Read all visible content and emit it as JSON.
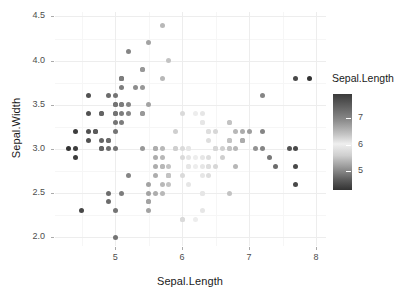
{
  "chart_data": {
    "type": "scatter",
    "title": "",
    "xlabel": "Sepal.Length",
    "ylabel": "Sepal.Width",
    "xlim": [
      4.1,
      8.15
    ],
    "ylim": [
      1.9,
      4.55
    ],
    "xticks": [
      5,
      6,
      7,
      8
    ],
    "xticklabels": [
      "5",
      "6",
      "7",
      "8"
    ],
    "yticks": [
      2.0,
      2.5,
      3.0,
      3.5,
      4.0,
      4.5
    ],
    "yticklabels": [
      "2.0",
      "2.5",
      "3.0",
      "3.5",
      "4.0",
      "4.5"
    ],
    "grid": true,
    "grid_color": "#ededed",
    "panel_background": "#ffffff",
    "point_size": 5,
    "color_by": "Sepal.Length",
    "colorscale": {
      "type": "continuous-gradient",
      "stops": [
        "#333333",
        "#6e6e6e",
        "#efefef",
        "#9a9a9a",
        "#333333"
      ],
      "note": "grayscale: dark at low values, lightest near 6, dark again at high values"
    },
    "legend": {
      "title": "Sepal.Length",
      "position": "right",
      "orientation": "vertical",
      "ticks": [
        7,
        6,
        5
      ],
      "ticklabels": [
        "7",
        "6",
        "5"
      ]
    },
    "x": [
      5.1,
      4.9,
      4.7,
      4.6,
      5.0,
      5.4,
      4.6,
      5.0,
      4.4,
      4.9,
      5.4,
      4.8,
      4.8,
      4.3,
      5.8,
      5.7,
      5.4,
      5.1,
      5.7,
      5.1,
      5.4,
      5.1,
      4.6,
      5.1,
      4.8,
      5.0,
      5.0,
      5.2,
      5.2,
      4.7,
      4.8,
      5.4,
      5.2,
      5.5,
      4.9,
      5.0,
      5.5,
      4.9,
      4.4,
      5.1,
      5.0,
      4.5,
      4.4,
      5.0,
      5.1,
      4.8,
      5.1,
      4.6,
      5.3,
      5.0,
      7.0,
      6.4,
      6.9,
      5.5,
      6.5,
      5.7,
      6.3,
      4.9,
      6.6,
      5.2,
      5.0,
      5.9,
      6.0,
      6.1,
      5.6,
      6.7,
      5.6,
      5.8,
      6.2,
      5.6,
      5.9,
      6.1,
      6.3,
      6.1,
      6.4,
      6.6,
      6.8,
      6.7,
      6.0,
      5.7,
      5.5,
      5.5,
      5.8,
      6.0,
      5.4,
      6.0,
      6.7,
      6.3,
      5.6,
      5.5,
      5.5,
      6.1,
      5.8,
      5.0,
      5.6,
      5.7,
      5.7,
      6.2,
      5.1,
      5.7,
      6.3,
      5.8,
      7.1,
      6.3,
      6.5,
      7.6,
      4.9,
      7.3,
      6.7,
      7.2,
      6.5,
      6.4,
      6.8,
      5.7,
      5.8,
      6.4,
      6.5,
      7.7,
      7.7,
      6.0,
      6.9,
      5.6,
      7.7,
      6.3,
      6.7,
      7.2,
      6.2,
      6.1,
      6.4,
      7.2,
      7.4,
      7.9,
      6.4,
      6.3,
      6.1,
      7.7,
      6.3,
      6.4,
      6.0,
      6.9,
      6.7,
      6.9,
      5.8,
      6.8,
      6.7,
      6.7,
      6.3,
      6.5,
      6.2,
      5.9
    ],
    "y": [
      3.5,
      3.0,
      3.2,
      3.1,
      3.6,
      3.9,
      3.4,
      3.4,
      2.9,
      3.1,
      3.7,
      3.4,
      3.0,
      3.0,
      4.0,
      4.4,
      3.9,
      3.5,
      3.8,
      3.8,
      3.4,
      3.7,
      3.6,
      3.3,
      3.4,
      3.0,
      3.4,
      3.5,
      3.4,
      3.2,
      3.1,
      3.4,
      4.1,
      4.2,
      3.1,
      3.2,
      3.5,
      3.6,
      3.0,
      3.4,
      3.5,
      2.3,
      3.2,
      3.5,
      3.8,
      3.0,
      3.8,
      3.2,
      3.7,
      3.3,
      3.2,
      3.2,
      3.1,
      2.3,
      2.8,
      2.8,
      3.3,
      2.4,
      2.9,
      2.7,
      2.0,
      3.0,
      2.2,
      2.9,
      2.9,
      3.1,
      3.0,
      2.7,
      2.2,
      2.5,
      3.2,
      2.8,
      2.5,
      2.8,
      2.9,
      3.0,
      2.8,
      3.0,
      2.9,
      2.6,
      2.4,
      2.4,
      2.7,
      2.7,
      3.0,
      3.4,
      3.1,
      2.3,
      3.0,
      2.5,
      2.6,
      3.0,
      2.6,
      2.3,
      2.7,
      3.0,
      2.9,
      2.9,
      2.5,
      2.8,
      3.3,
      2.7,
      3.0,
      2.9,
      3.0,
      3.0,
      2.5,
      2.9,
      2.5,
      3.6,
      3.2,
      2.7,
      3.0,
      2.5,
      2.8,
      3.2,
      3.0,
      3.8,
      2.6,
      2.2,
      3.2,
      2.8,
      2.8,
      2.7,
      3.3,
      3.2,
      2.8,
      3.0,
      2.8,
      3.0,
      2.8,
      3.8,
      2.8,
      2.8,
      2.6,
      3.0,
      3.4,
      3.1,
      3.0,
      3.1,
      3.1,
      3.1,
      2.7,
      3.2,
      3.3,
      3.0,
      2.5,
      3.0,
      3.4,
      3.0
    ]
  }
}
